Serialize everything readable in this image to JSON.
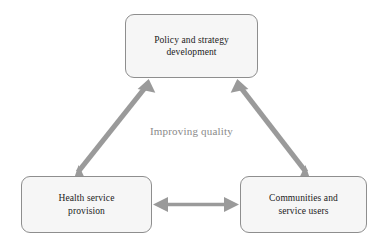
{
  "diagram": {
    "title": "Improving quality",
    "center_label": "Improving quality",
    "background_color": "#ffffff",
    "node_fill_color": "#f6f6f6",
    "node_border_color": "#8e8e8e",
    "node_text_color": "#1a1a1a",
    "arrow_color": "#9a9a9a",
    "center_label_color": "#8a8a8a",
    "nodes": [
      {
        "id": "policy",
        "label": "Policy and strategy\ndevelopment",
        "position": "top-center"
      },
      {
        "id": "health",
        "label": "Health service\nprovision",
        "position": "bottom-left"
      },
      {
        "id": "communities",
        "label": "Communities and\nservice users",
        "position": "bottom-right"
      }
    ],
    "connections": [
      {
        "id": "policy-health",
        "from": "policy",
        "to": "health",
        "arrowheads": "both"
      },
      {
        "id": "policy-communities",
        "from": "policy",
        "to": "communities",
        "arrowheads": "both"
      },
      {
        "id": "health-communities",
        "from": "health",
        "to": "communities",
        "arrowheads": "both"
      }
    ]
  }
}
